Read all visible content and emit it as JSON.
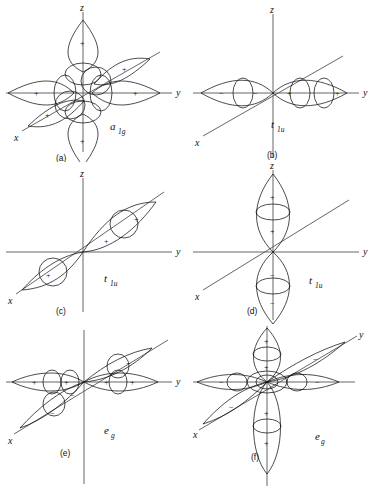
{
  "figure": {
    "background_color": "#ffffff",
    "line_color": "#111111",
    "axis_color": "#555555"
  },
  "axes": {
    "z": "z",
    "y": "y",
    "x": "x"
  },
  "signs": {
    "plus": "+",
    "minus": "−"
  },
  "panels": [
    {
      "id": "a",
      "caption": "(a)",
      "symmetry_main": "a",
      "symmetry_sub": "1g",
      "description": "All six ligand sigma orbitals in phase (totally symmetric combination)",
      "lobes": [
        {
          "axis": "+z",
          "sign": "+",
          "shaded": true
        },
        {
          "axis": "-z",
          "sign": "+",
          "shaded": true
        },
        {
          "axis": "+y",
          "sign": "+",
          "shaded": true
        },
        {
          "axis": "-y",
          "sign": "+",
          "shaded": true
        },
        {
          "axis": "+x",
          "sign": "+",
          "shaded": true
        },
        {
          "axis": "-x",
          "sign": "+",
          "shaded": true
        }
      ]
    },
    {
      "id": "b",
      "caption": "(b)",
      "symmetry_main": "t",
      "symmetry_sub": "1u",
      "description": "Ligand pair along the y axis, antisymmetric",
      "lobes": [
        {
          "axis": "+y",
          "sign": "+",
          "shaded": true
        },
        {
          "axis": "-y",
          "sign": "−",
          "shaded": false
        }
      ]
    },
    {
      "id": "c",
      "caption": "(c)",
      "symmetry_main": "t",
      "symmetry_sub": "1u",
      "description": "Ligand pair along the x axis, antisymmetric",
      "lobes": [
        {
          "axis": "+x",
          "sign": "+",
          "shaded": true
        },
        {
          "axis": "-x",
          "sign": "+",
          "shaded": false
        }
      ]
    },
    {
      "id": "d",
      "caption": "(d)",
      "symmetry_main": "t",
      "symmetry_sub": "1u",
      "description": "Ligand pair along the z axis, antisymmetric",
      "lobes": [
        {
          "axis": "+z",
          "sign": "+",
          "shaded": true
        },
        {
          "axis": "-z",
          "sign": "−",
          "shaded": false
        }
      ]
    },
    {
      "id": "e",
      "caption": "(e)",
      "symmetry_main": "e",
      "symmetry_sub": "g",
      "description": "x2-y2 type combination: plus along y, minus along x",
      "lobes": [
        {
          "axis": "+y",
          "sign": "+",
          "shaded": true
        },
        {
          "axis": "-y",
          "sign": "+",
          "shaded": true
        },
        {
          "axis": "+x",
          "sign": "−",
          "shaded": false
        },
        {
          "axis": "-x",
          "sign": "−",
          "shaded": false
        }
      ]
    },
    {
      "id": "f",
      "caption": "(f)",
      "symmetry_main": "e",
      "symmetry_sub": "g",
      "description": "z2 type combination: plus along z, minus along x and y",
      "lobes": [
        {
          "axis": "+z",
          "sign": "+",
          "shaded": true
        },
        {
          "axis": "-z",
          "sign": "+",
          "shaded": true
        },
        {
          "axis": "+y",
          "sign": "−",
          "shaded": false
        },
        {
          "axis": "-y",
          "sign": "−",
          "shaded": false
        },
        {
          "axis": "+x",
          "sign": "−",
          "shaded": false
        },
        {
          "axis": "-x",
          "sign": "−",
          "shaded": false
        }
      ]
    }
  ]
}
